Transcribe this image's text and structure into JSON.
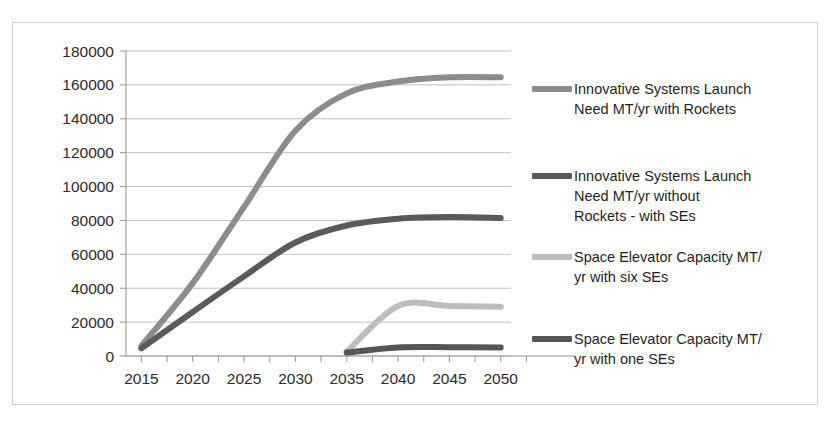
{
  "chart_data": {
    "type": "line",
    "title": "",
    "xlabel": "",
    "ylabel": "",
    "x": [
      2015,
      2020,
      2025,
      2030,
      2035,
      2040,
      2045,
      2050
    ],
    "xlim": [
      2013.5,
      2051
    ],
    "ylim": [
      0,
      180000
    ],
    "ytick_values": [
      0,
      20000,
      40000,
      60000,
      80000,
      100000,
      120000,
      140000,
      160000,
      180000
    ],
    "ytick_labels": [
      "0",
      "20000",
      "40000",
      "60000",
      "80000",
      "100000",
      "120000",
      "140000",
      "160000",
      "180000"
    ],
    "xtick_labels": [
      "2015",
      "2020",
      "2025",
      "2030",
      "2035",
      "2040",
      "2045",
      "2050"
    ],
    "grid": true,
    "legend_position": "right",
    "series": [
      {
        "name": "Innovative Systems Launch Need MT/yr with Rockets",
        "legend_label": "Innovative Systems Launch\nNeed MT/yr with Rockets",
        "color": "#8c8c8c",
        "width": 6,
        "x": [
          2015,
          2020,
          2025,
          2030,
          2035,
          2040,
          2045,
          2050
        ],
        "values": [
          6000,
          43000,
          88000,
          133000,
          155000,
          162000,
          164500,
          164500
        ]
      },
      {
        "name": "Innovative Systems Launch Need MT/yr without Rockets - with SEs",
        "legend_label": "Innovative Systems Launch\nNeed MT/yr without\nRockets - with SEs",
        "color": "#5a5a5a",
        "width": 6,
        "x": [
          2015,
          2020,
          2025,
          2030,
          2035,
          2040,
          2045,
          2050
        ],
        "values": [
          4500,
          26000,
          47000,
          67000,
          77000,
          81000,
          82000,
          81500
        ]
      },
      {
        "name": "Space Elevator Capacity MT/yr with six SEs",
        "legend_label": "Space Elevator Capacity MT/\nyr with six SEs",
        "color": "#bdbdbd",
        "width": 6,
        "x": [
          2035,
          2040,
          2045,
          2050
        ],
        "values": [
          2500,
          29500,
          29500,
          29000
        ]
      },
      {
        "name": "Space Elevator Capacity MT/yr with one SEs",
        "legend_label": "Space Elevator Capacity MT/\nyr with one SEs",
        "color": "#555555",
        "width": 6,
        "x": [
          2035,
          2040,
          2045,
          2050
        ],
        "values": [
          2000,
          5000,
          5200,
          5000
        ]
      }
    ]
  },
  "legend": {
    "entries": [
      {
        "label": "Innovative Systems Launch\nNeed MT/yr with Rockets",
        "color": "#8c8c8c",
        "top": 8
      },
      {
        "label": "Innovative Systems Launch\nNeed MT/yr without\nRockets - with SEs",
        "color": "#5a5a5a",
        "top": 95
      },
      {
        "label": "Space Elevator Capacity MT/\nyr with six SEs",
        "color": "#bdbdbd",
        "top": 176
      },
      {
        "label": "Space Elevator Capacity MT/\nyr with one SEs",
        "color": "#555555",
        "top": 258
      }
    ]
  },
  "colors": {
    "frame_border": "#cfcfcf",
    "gridline": "#b9b9b9",
    "axis": "#9a9a9a",
    "tick_text": "#2b2b2b",
    "legend_text": "#1f1f1f",
    "background": "#ffffff"
  }
}
